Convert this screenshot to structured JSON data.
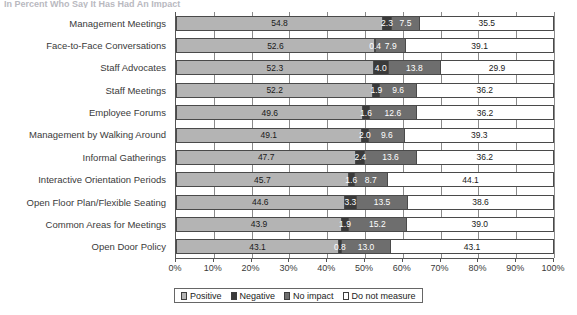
{
  "clipped_title": "In Percent Who Say It Has Had An Impact",
  "chart_data": {
    "type": "bar",
    "orientation": "horizontal",
    "stacked": true,
    "stack_mode": "percent",
    "title": "",
    "subtitle": "",
    "xlabel": "",
    "ylabel": "",
    "xlim": [
      0,
      100
    ],
    "grid": true,
    "legend_position": "bottom",
    "categories": [
      "Management Meetings",
      "Face-to-Face Conversations",
      "Staff Advocates",
      "Staff Meetings",
      "Employee Forums",
      "Management by Walking Around",
      "Informal Gatherings",
      "Interactive Orientation Periods",
      "Open Floor Plan/Flexible Seating",
      "Common Areas for Meetings",
      "Open Door Policy"
    ],
    "series": [
      {
        "name": "Positive",
        "color": "#b4b4b4",
        "values": [
          54.8,
          52.6,
          52.3,
          52.2,
          49.6,
          49.1,
          47.7,
          45.7,
          44.6,
          43.9,
          43.1
        ]
      },
      {
        "name": "Negative",
        "color": "#3a3a3a",
        "values": [
          2.3,
          0.4,
          4.0,
          1.9,
          1.6,
          2.0,
          2.4,
          1.6,
          3.3,
          1.9,
          0.8
        ]
      },
      {
        "name": "No impact",
        "color": "#6e6e6e",
        "values": [
          7.5,
          7.9,
          13.8,
          9.6,
          12.6,
          9.6,
          13.6,
          8.7,
          13.5,
          15.2,
          13.0
        ]
      },
      {
        "name": "Do not measure",
        "color": "#ffffff",
        "values": [
          35.5,
          39.1,
          29.9,
          36.2,
          36.2,
          39.3,
          36.2,
          44.1,
          38.6,
          39.0,
          43.1
        ]
      }
    ],
    "xticks": [
      0,
      10,
      20,
      30,
      40,
      50,
      60,
      70,
      80,
      90,
      100
    ],
    "xticklabels": [
      "0%",
      "10%",
      "20%",
      "30%",
      "40%",
      "50%",
      "60%",
      "70%",
      "80%",
      "90%",
      "100%"
    ]
  },
  "legend": {
    "items": [
      {
        "label": "Positive",
        "color": "#b4b4b4"
      },
      {
        "label": "Negative",
        "color": "#3a3a3a"
      },
      {
        "label": "No impact",
        "color": "#6e6e6e"
      },
      {
        "label": "Do not measure",
        "color": "#ffffff"
      }
    ]
  }
}
